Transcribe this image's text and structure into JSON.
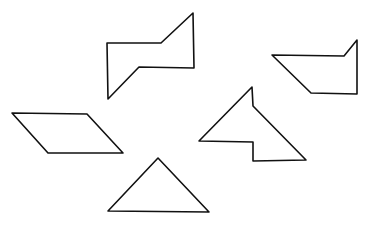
{
  "canvas": {
    "width": 373,
    "height": 228,
    "background": "#ffffff",
    "stroke": "#111111"
  },
  "shapes": [
    {
      "name": "bowtie-hexagon",
      "points": "107,43 161,43 193,13 194,68 139,67 108,99"
    },
    {
      "name": "boat-pentagon",
      "points": "272,55 344,56 357,40 357,94 311,93"
    },
    {
      "name": "notched-arrow-shape",
      "points": "252,87 253,106 306,160 253,161 253,142 199,141"
    },
    {
      "name": "parallelogram",
      "points": "12,113 87,114 123,153 48,153"
    },
    {
      "name": "triangle",
      "points": "158,158 108,211 209,212"
    }
  ]
}
